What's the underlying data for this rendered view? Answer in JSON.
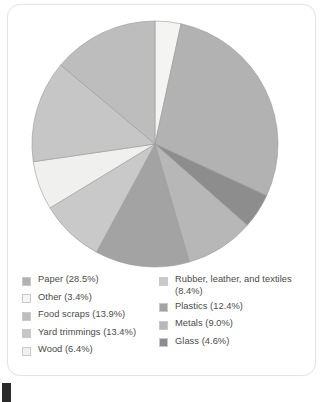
{
  "chart_data": {
    "type": "pie",
    "title": "",
    "xlabel": "",
    "ylabel": "",
    "legend_position": "bottom",
    "grid": false,
    "units": "percent",
    "start_angle_deg": 0,
    "direction": "clockwise",
    "categories": [
      "Paper",
      "Other",
      "Food scraps",
      "Yard trimmings",
      "Wood",
      "Rubber, leather, and textiles",
      "Plastics",
      "Metals",
      "Glass"
    ],
    "values": [
      28.5,
      3.4,
      13.9,
      13.4,
      6.4,
      8.4,
      12.4,
      9.0,
      4.6
    ],
    "colors": [
      "#b2b2b2",
      "#f4f4f2",
      "#bdbdbd",
      "#c6c6c6",
      "#f0f0ee",
      "#c9c9c9",
      "#a3a3a3",
      "#b7b7b7",
      "#8d8d8d"
    ],
    "slices": [
      {
        "label": "Other",
        "value": 3.4,
        "color": "#f4f4f2",
        "start_deg": 0.0,
        "end_deg": 12.24
      },
      {
        "label": "Paper",
        "value": 28.5,
        "color": "#b2b2b2",
        "start_deg": 12.24,
        "end_deg": 114.84
      },
      {
        "label": "Glass",
        "value": 4.6,
        "color": "#8d8d8d",
        "start_deg": 114.84,
        "end_deg": 131.4
      },
      {
        "label": "Metals",
        "value": 9.0,
        "color": "#b7b7b7",
        "start_deg": 131.4,
        "end_deg": 163.8
      },
      {
        "label": "Plastics",
        "value": 12.4,
        "color": "#a3a3a3",
        "start_deg": 163.8,
        "end_deg": 208.44
      },
      {
        "label": "Rubber, leather, and textiles",
        "value": 8.4,
        "color": "#c9c9c9",
        "start_deg": 208.44,
        "end_deg": 238.68
      },
      {
        "label": "Wood",
        "value": 6.4,
        "color": "#f0f0ee",
        "start_deg": 238.68,
        "end_deg": 261.72
      },
      {
        "label": "Yard trimmings",
        "value": 13.4,
        "color": "#c6c6c6",
        "start_deg": 261.72,
        "end_deg": 309.96
      },
      {
        "label": "Food scraps",
        "value": 13.9,
        "color": "#bdbdbd",
        "start_deg": 309.96,
        "end_deg": 360.0
      }
    ]
  },
  "legend": {
    "left_column": [
      {
        "label": "Paper (28.5%)",
        "color": "#b2b2b2"
      },
      {
        "label": "Other (3.4%)",
        "color": "#f4f4f2"
      },
      {
        "label": "Food scraps (13.9%)",
        "color": "#bdbdbd"
      },
      {
        "label": "Yard trimmings (13.4%)",
        "color": "#c6c6c6"
      },
      {
        "label": "Wood (6.4%)",
        "color": "#f0f0ee"
      }
    ],
    "right_column": [
      {
        "label": "Rubber, leather, and textiles\n(8.4%)",
        "color": "#c9c9c9"
      },
      {
        "label": "Plastics (12.4%)",
        "color": "#a3a3a3"
      },
      {
        "label": "Metals (9.0%)",
        "color": "#b7b7b7"
      },
      {
        "label": "Glass (4.6%)",
        "color": "#8d8d8d"
      }
    ]
  },
  "style": {
    "card_background": "#ffffff",
    "card_border": "#e3e3e3",
    "legend_text_color": "#4a4a4a",
    "slice_outline": "#9a9a9a",
    "artifact_color": "#2b2b2b"
  }
}
